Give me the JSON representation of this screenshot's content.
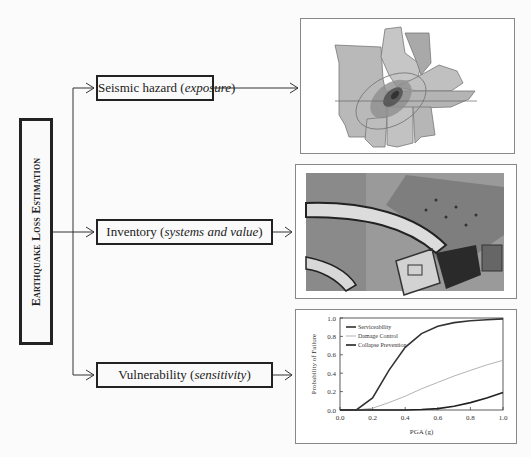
{
  "diagram": {
    "root": {
      "label": "Earthquake Loss Estimation"
    },
    "components": [
      {
        "label": "Seismic hazard",
        "qualifier": "exposure",
        "panel": "map"
      },
      {
        "label": "Inventory",
        "qualifier": "systems and value",
        "panel": "aerial-photo"
      },
      {
        "label": "Vulnerability",
        "qualifier": "sensitivity",
        "panel": "fragility-chart"
      }
    ]
  },
  "chart_data": {
    "type": "line",
    "title": "",
    "xlabel": "PGA (g)",
    "ylabel": "Probability of Failure",
    "xlim": [
      0.0,
      1.0
    ],
    "ylim": [
      0.0,
      1.0
    ],
    "xticks": [
      "0.0",
      "0.2",
      "0.4",
      "0.6",
      "0.8",
      "1.0"
    ],
    "yticks": [
      "0.0",
      "0.2",
      "0.4",
      "0.6",
      "0.8",
      "1.0"
    ],
    "legend": {
      "position": "upper-left",
      "entries": [
        "Serviceability",
        "Damage Control",
        "Collapse Prevention"
      ]
    },
    "x": [
      0.1,
      0.2,
      0.3,
      0.4,
      0.5,
      0.6,
      0.7,
      0.8,
      0.9,
      1.0
    ],
    "series": [
      {
        "name": "Serviceability",
        "color": "#333333",
        "values": [
          0.0,
          0.13,
          0.43,
          0.68,
          0.83,
          0.91,
          0.95,
          0.97,
          0.98,
          0.99
        ]
      },
      {
        "name": "Damage Control",
        "color": "#aaaaaa",
        "values": [
          0.0,
          0.02,
          0.08,
          0.15,
          0.23,
          0.3,
          0.37,
          0.43,
          0.49,
          0.54
        ]
      },
      {
        "name": "Collapse Prevention",
        "color": "#222222",
        "values": [
          0.0,
          0.0,
          0.0,
          0.0,
          0.005,
          0.015,
          0.04,
          0.08,
          0.13,
          0.19
        ]
      }
    ]
  }
}
